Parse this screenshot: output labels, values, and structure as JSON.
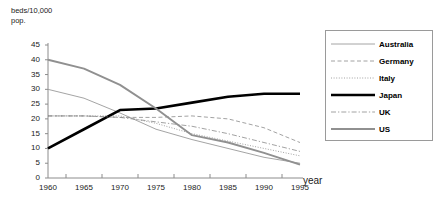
{
  "chart_data": {
    "type": "line",
    "title": "",
    "ylabel": "beds/10,000\npop.",
    "xlabel": "year",
    "x": [
      1960,
      1965,
      1970,
      1975,
      1980,
      1985,
      1990,
      1995
    ],
    "xticklabels": [
      "1960",
      "1965",
      "1970",
      "1975",
      "1980",
      "1985",
      "1990",
      "1995"
    ],
    "yticklabels": [
      "0",
      "5",
      "10",
      "15",
      "20",
      "25",
      "30",
      "35",
      "40",
      "45"
    ],
    "yticks": [
      0,
      5,
      10,
      15,
      20,
      25,
      30,
      35,
      40,
      45
    ],
    "ylim": [
      0,
      45
    ],
    "xlim": [
      1960,
      1995
    ],
    "grid": false,
    "legend_position": "right",
    "series": [
      {
        "name": "Australia",
        "style": "solid-thin",
        "color": "#9a9a9a",
        "values": [
          30.0,
          27.0,
          22.0,
          16.5,
          13.0,
          10.0,
          7.0,
          5.0
        ]
      },
      {
        "name": "Germany",
        "style": "dashed",
        "color": "#8a8a8a",
        "values": [
          21.0,
          21.0,
          20.5,
          20.5,
          21.0,
          20.0,
          17.0,
          12.0
        ]
      },
      {
        "name": "Italy",
        "style": "dotted",
        "color": "#8a8a8a",
        "values": [
          21.0,
          21.0,
          21.0,
          18.5,
          15.0,
          12.5,
          10.0,
          7.5
        ]
      },
      {
        "name": "Japan",
        "style": "solid-thick",
        "color": "#000000",
        "values": [
          10.0,
          16.5,
          23.0,
          23.5,
          25.5,
          27.5,
          28.5,
          28.5
        ]
      },
      {
        "name": "UK",
        "style": "dash-dot",
        "color": "#8a8a8a",
        "values": [
          21.0,
          21.0,
          20.5,
          19.0,
          17.5,
          15.0,
          12.0,
          9.0
        ]
      },
      {
        "name": "US",
        "style": "solid-medium",
        "color": "#909090",
        "values": [
          40.0,
          37.0,
          31.5,
          23.5,
          14.5,
          12.0,
          8.5,
          4.5
        ]
      }
    ]
  },
  "legend": {
    "items": [
      {
        "label": "Australia"
      },
      {
        "label": "Germany"
      },
      {
        "label": "Italy"
      },
      {
        "label": "Japan"
      },
      {
        "label": "UK"
      },
      {
        "label": "US"
      }
    ]
  },
  "axes": {
    "y_axis_title": "beds/10,000\npop.",
    "x_axis_title": "year"
  }
}
